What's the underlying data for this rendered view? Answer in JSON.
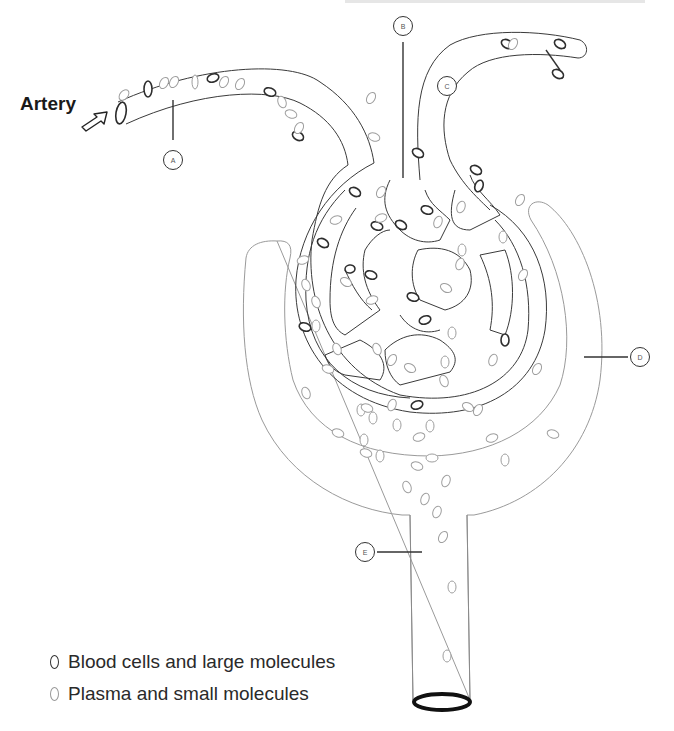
{
  "artery_label": "Artery",
  "markers": [
    {
      "id": "A",
      "letter": "A",
      "x": 163,
      "y": 150
    },
    {
      "id": "B",
      "letter": "B",
      "x": 391,
      "y": 16
    },
    {
      "id": "C",
      "letter": "C",
      "x": 440,
      "y": 76,
      "cx": 448,
      "cy": 86
    },
    {
      "id": "D",
      "letter": "D",
      "x": 607,
      "y": 347
    },
    {
      "id": "E",
      "letter": "E",
      "x": 355,
      "y": 540
    }
  ],
  "legend": [
    {
      "type": "dark",
      "label": "Blood cells and large molecules",
      "top": 651
    },
    {
      "type": "light",
      "label": "Plasma and small molecules",
      "top": 683
    }
  ],
  "colors": {
    "vessel_stroke": "#3a3a3a",
    "capsule_stroke": "#9a9a9a",
    "dark_cell": "#2e2e2e",
    "light_cell": "#9e9e9e",
    "background": "#ffffff"
  },
  "cells": {
    "dark": [
      [
        148,
        89,
        4,
        8,
        0
      ],
      [
        213,
        78,
        6,
        4,
        -20
      ],
      [
        270,
        92,
        6,
        4,
        20
      ],
      [
        298,
        136,
        6,
        4,
        30
      ],
      [
        355,
        192,
        6,
        4,
        30
      ],
      [
        371,
        275,
        6,
        4,
        20
      ],
      [
        323,
        243,
        6,
        4,
        30
      ],
      [
        350,
        269,
        5,
        4,
        -10
      ],
      [
        413,
        297,
        6,
        4,
        20
      ],
      [
        427,
        210,
        6,
        4,
        20
      ],
      [
        479,
        186,
        4,
        6,
        20
      ],
      [
        505,
        340,
        4,
        6,
        0
      ],
      [
        305,
        327,
        6,
        4,
        20
      ],
      [
        417,
        405,
        6,
        4,
        -20
      ],
      [
        507,
        44,
        6,
        4,
        30
      ],
      [
        560,
        44,
        6,
        4,
        30
      ],
      [
        476,
        170,
        6,
        4,
        30
      ],
      [
        418,
        153,
        6,
        4,
        30
      ],
      [
        558,
        74,
        6,
        4,
        30
      ],
      [
        425,
        320,
        6,
        4,
        -20
      ],
      [
        401,
        225,
        6,
        4,
        30
      ],
      [
        377,
        226,
        6,
        4,
        20
      ]
    ],
    "light": [
      [
        124,
        95,
        6,
        4,
        -50
      ],
      [
        164,
        83,
        4,
        6,
        30
      ],
      [
        174,
        82,
        4,
        6,
        30
      ],
      [
        195,
        82,
        3,
        7,
        0
      ],
      [
        224,
        82,
        4,
        6,
        30
      ],
      [
        240,
        84,
        4,
        6,
        30
      ],
      [
        282,
        102,
        4,
        6,
        -20
      ],
      [
        291,
        114,
        6,
        4,
        20
      ],
      [
        299,
        128,
        4,
        6,
        30
      ],
      [
        371,
        98,
        4,
        6,
        30
      ],
      [
        374,
        137,
        6,
        4,
        20
      ],
      [
        381,
        192,
        4,
        6,
        30
      ],
      [
        381,
        218,
        6,
        4,
        -20
      ],
      [
        336,
        220,
        6,
        4,
        -20
      ],
      [
        303,
        260,
        6,
        4,
        -20
      ],
      [
        306,
        285,
        4,
        6,
        -20
      ],
      [
        316,
        302,
        4,
        6,
        -20
      ],
      [
        316,
        326,
        4,
        6,
        0
      ],
      [
        328,
        369,
        6,
        4,
        20
      ],
      [
        337,
        349,
        4,
        6,
        -20
      ],
      [
        346,
        282,
        6,
        4,
        30
      ],
      [
        372,
        300,
        6,
        4,
        -20
      ],
      [
        377,
        349,
        4,
        6,
        -20
      ],
      [
        392,
        360,
        4,
        6,
        30
      ],
      [
        410,
        368,
        6,
        4,
        30
      ],
      [
        445,
        362,
        4,
        6,
        0
      ],
      [
        468,
        407,
        6,
        4,
        30
      ],
      [
        478,
        410,
        4,
        6,
        30
      ],
      [
        452,
        333,
        4,
        6,
        0
      ],
      [
        461,
        207,
        4,
        6,
        20
      ],
      [
        523,
        275,
        4,
        6,
        30
      ],
      [
        537,
        369,
        4,
        6,
        30
      ],
      [
        553,
        434,
        6,
        4,
        20
      ],
      [
        392,
        405,
        4,
        6,
        20
      ],
      [
        446,
        288,
        6,
        4,
        30
      ],
      [
        493,
        360,
        4,
        6,
        20
      ],
      [
        438,
        222,
        4,
        6,
        20
      ],
      [
        462,
        250,
        4,
        6,
        0
      ],
      [
        513,
        44,
        4,
        6,
        30
      ],
      [
        460,
        264,
        4,
        6,
        20
      ],
      [
        520,
        200,
        4,
        6,
        30
      ],
      [
        503,
        237,
        4,
        6,
        0
      ],
      [
        306,
        393,
        4,
        6,
        -20
      ],
      [
        361,
        410,
        4,
        6,
        0
      ],
      [
        338,
        433,
        6,
        4,
        20
      ],
      [
        444,
        381,
        4,
        6,
        -20
      ],
      [
        397,
        425,
        4,
        6,
        0
      ],
      [
        430,
        426,
        4,
        6,
        0
      ],
      [
        492,
        438,
        6,
        4,
        -20
      ],
      [
        505,
        460,
        4,
        6,
        0
      ],
      [
        419,
        437,
        6,
        4,
        -20
      ],
      [
        407,
        487,
        4,
        6,
        -20
      ],
      [
        380,
        456,
        4,
        6,
        0
      ],
      [
        432,
        458,
        6,
        4,
        0
      ],
      [
        446,
        481,
        4,
        6,
        20
      ],
      [
        425,
        499,
        4,
        6,
        20
      ],
      [
        366,
        453,
        6,
        4,
        20
      ],
      [
        437,
        512,
        4,
        6,
        20
      ],
      [
        443,
        537,
        4,
        6,
        30
      ],
      [
        452,
        587,
        4,
        6,
        0
      ],
      [
        447,
        656,
        4,
        6,
        0
      ],
      [
        367,
        408,
        6,
        4,
        20
      ],
      [
        364,
        440,
        4,
        6,
        0
      ],
      [
        417,
        466,
        6,
        4,
        20
      ],
      [
        373,
        418,
        4,
        6,
        0
      ]
    ]
  }
}
